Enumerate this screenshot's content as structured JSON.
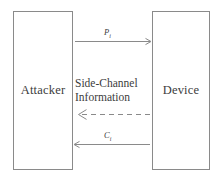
{
  "figure": {
    "type": "side-channel-attack-diagram",
    "background_color": "#ffffff",
    "line_color": "#8a8a8a",
    "text_color": "#3c3c3c"
  },
  "entities": {
    "left": {
      "name": "attacker",
      "label": "Attacker"
    },
    "right": {
      "name": "device",
      "label": "Device"
    }
  },
  "messages": {
    "plaintext": {
      "symbol": "P",
      "subscript": "i",
      "direction": "attacker-to-device",
      "style": "solid"
    },
    "ciphertext": {
      "symbol": "C",
      "subscript": "i",
      "direction": "device-to-attacker",
      "style": "solid"
    },
    "side_channel": {
      "line1": "Side-Channel",
      "line2": "Information",
      "direction": "device-to-attacker",
      "style": "dashed"
    }
  }
}
